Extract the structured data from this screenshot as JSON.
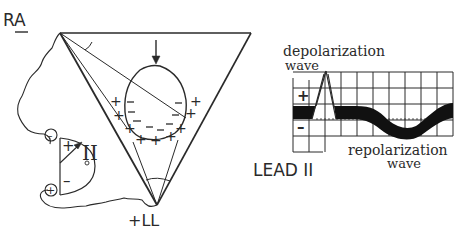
{
  "diagram": {
    "electrodes": {
      "right_arm": "RA",
      "left_leg": "+LL"
    },
    "lead_axis_label": "II",
    "heart_charges": {
      "outer": "+",
      "inner": "–"
    },
    "galvanometer": {
      "top_terminal": "–",
      "bottom_terminal": "+",
      "plus_label": "+",
      "minus_label": "–",
      "zero_label": "0"
    },
    "ecg_trace": {
      "title": "LEAD II",
      "positive_label": "+",
      "negative_label": "–",
      "depolarization_label_line1": "depolarization",
      "depolarization_label_line2": "wave",
      "repolarization_label_line1": "repolarization",
      "repolarization_label_line2": "wave"
    },
    "colors": {
      "ink": "#2a2a2a",
      "background": "#ffffff"
    }
  }
}
